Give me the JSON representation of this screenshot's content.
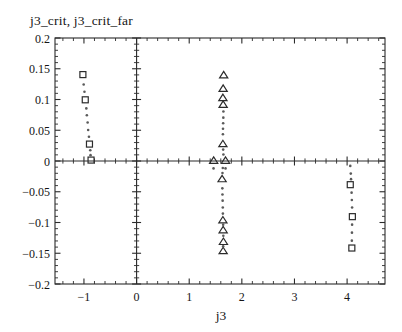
{
  "chart_data": {
    "type": "scatter",
    "title": "j3_crit, j3_crit_far",
    "xlabel": "j3",
    "ylabel": "",
    "xlim": [
      -1.55,
      4.72
    ],
    "ylim": [
      -0.2,
      0.2
    ],
    "xticks": [
      -1,
      0,
      1,
      2,
      3,
      4
    ],
    "xticklabels": [
      "−1",
      "0",
      "1",
      "2",
      "3",
      "4"
    ],
    "yticks": [
      0.2,
      0.15,
      0.1,
      0.05,
      0,
      -0.05,
      -0.1,
      -0.15,
      -0.2
    ],
    "yticklabels": [
      "0.2",
      "0.15",
      "0.1",
      "0.05",
      "0",
      "−0.05",
      "−0.1",
      "−0.15",
      "−0.2"
    ],
    "minor_ticks_per_interval": 5,
    "grid": false,
    "legend": null,
    "axis_lines": {
      "x_zero": 0,
      "y_zero": 0
    },
    "series": [
      {
        "name": "j3_crit",
        "marker": "square",
        "marker_size": 6,
        "color": "#2b2b2b",
        "points": [
          {
            "x": -1.02,
            "y": 0.1405
          },
          {
            "x": -0.975,
            "y": 0.0995
          },
          {
            "x": -0.895,
            "y": 0.0275
          },
          {
            "x": -0.865,
            "y": 0.0015
          },
          {
            "x": 4.06,
            "y": -0.0385
          },
          {
            "x": 4.1,
            "y": -0.0905
          },
          {
            "x": 4.09,
            "y": -0.1415
          }
        ]
      },
      {
        "name": "j3_crit_far",
        "marker": "triangle",
        "marker_size": 7,
        "color": "#2b2b2b",
        "points": [
          {
            "x": 1.655,
            "y": 0.1405
          },
          {
            "x": 1.645,
            "y": 0.1185
          },
          {
            "x": 1.64,
            "y": 0.1035
          },
          {
            "x": 1.645,
            "y": 0.0925
          },
          {
            "x": 1.64,
            "y": 0.0285
          },
          {
            "x": 1.465,
            "y": 0.0015
          },
          {
            "x": 1.69,
            "y": 0.0015
          },
          {
            "x": 1.625,
            "y": -0.0285
          },
          {
            "x": 1.64,
            "y": -0.0955
          },
          {
            "x": 1.645,
            "y": -0.1115
          },
          {
            "x": 1.65,
            "y": -0.1305
          },
          {
            "x": 1.645,
            "y": -0.1455
          }
        ]
      },
      {
        "name": "trail-dots",
        "marker": "dot",
        "marker_size": 1.3,
        "color": "#5a5a5a",
        "points": [
          {
            "x": -1.005,
            "y": 0.1245
          },
          {
            "x": -0.99,
            "y": 0.1125
          },
          {
            "x": -0.955,
            "y": 0.0855
          },
          {
            "x": -0.945,
            "y": 0.0745
          },
          {
            "x": -0.93,
            "y": 0.0625
          },
          {
            "x": -0.92,
            "y": 0.0505
          },
          {
            "x": -0.905,
            "y": 0.0395
          },
          {
            "x": -0.88,
            "y": 0.0175
          },
          {
            "x": -0.875,
            "y": 0.0095
          },
          {
            "x": 1.65,
            "y": 0.0805
          },
          {
            "x": 1.648,
            "y": 0.0705
          },
          {
            "x": 1.645,
            "y": 0.0615
          },
          {
            "x": 1.642,
            "y": 0.0525
          },
          {
            "x": 1.64,
            "y": 0.0435
          },
          {
            "x": 1.645,
            "y": 0.0185
          },
          {
            "x": 1.65,
            "y": 0.0105
          },
          {
            "x": 1.638,
            "y": -0.0115
          },
          {
            "x": 1.632,
            "y": -0.0195
          },
          {
            "x": 1.63,
            "y": -0.0445
          },
          {
            "x": 1.632,
            "y": -0.0545
          },
          {
            "x": 1.635,
            "y": -0.0645
          },
          {
            "x": 1.638,
            "y": -0.0755
          },
          {
            "x": 1.64,
            "y": -0.0855
          },
          {
            "x": 1.645,
            "y": -0.1035
          },
          {
            "x": 1.648,
            "y": -0.1215
          },
          {
            "x": 1.645,
            "y": -0.1385
          },
          {
            "x": 4.07,
            "y": -0.0205
          },
          {
            "x": 4.075,
            "y": -0.0295
          },
          {
            "x": 4.085,
            "y": -0.0515
          },
          {
            "x": 4.09,
            "y": -0.0635
          },
          {
            "x": 4.095,
            "y": -0.0755
          },
          {
            "x": 4.095,
            "y": -0.1035
          },
          {
            "x": 4.092,
            "y": -0.1165
          },
          {
            "x": 4.09,
            "y": -0.1295
          },
          {
            "x": 1.462,
            "y": -0.012
          },
          {
            "x": 1.69,
            "y": -0.012
          },
          {
            "x": 4.06,
            "y": -0.008
          }
        ]
      }
    ]
  },
  "figure": {
    "background": "#ffffff",
    "foreground": "#1a1a1a"
  }
}
